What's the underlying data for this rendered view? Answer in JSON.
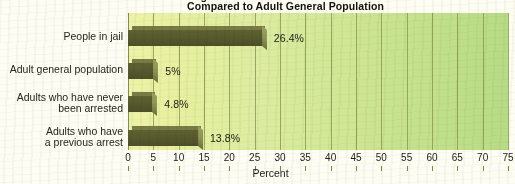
{
  "title": {
    "line1": "Percentage of Adults with Mental Illness",
    "line2": "Compared to Adult General Population"
  },
  "axis": {
    "x_label": "Percent",
    "x_min": 0,
    "x_max": 75,
    "x_step": 5,
    "x_ticks": [
      "0",
      "5",
      "10",
      "15",
      "20",
      "25",
      "30",
      "35",
      "40",
      "45",
      "50",
      "55",
      "60",
      "65",
      "70",
      "75"
    ]
  },
  "colors": {
    "bar": "#585b2e",
    "bar_highlight": "#8b9154",
    "plot_left": "#eef2a8",
    "plot_right": "#b7db85",
    "gridline": "#8d9b52",
    "text": "#1b1b16",
    "page": "#fdfdf4"
  },
  "chart_data": {
    "type": "bar",
    "orientation": "horizontal",
    "title": "Percentage of Adults with Mental Illness Compared to Adult General Population",
    "xlabel": "Percent",
    "ylabel": "",
    "xlim": [
      0,
      75
    ],
    "grid": true,
    "legend": "none",
    "categories": [
      "People in jail",
      "Adult general population",
      "Adults who have never\nbeen arrested",
      "Adults who have\na previous arrest"
    ],
    "values": [
      26.4,
      5,
      4.8,
      13.8
    ],
    "data_labels": [
      "26.4%",
      "5%",
      "4.8%",
      "13.8%"
    ]
  }
}
